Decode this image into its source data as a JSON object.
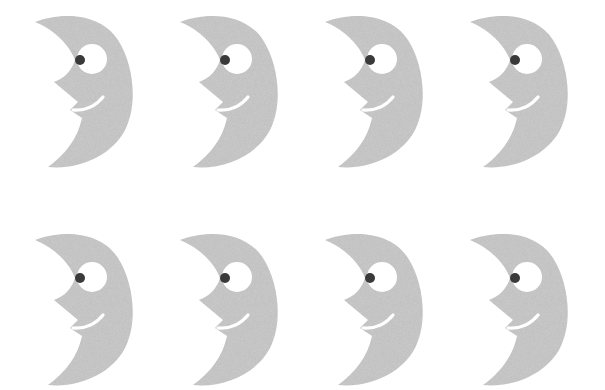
{
  "figure": {
    "rows": 2,
    "columns": 4,
    "colors": {
      "background": "#ffffff",
      "moon_fill": "#cdcdcd",
      "eye_white": "#ffffff",
      "pupil": "#3a3a3a",
      "smile": "#ffffff"
    },
    "moons": [
      {
        "row": 0,
        "col": 0,
        "x": 30,
        "y": 10
      },
      {
        "row": 0,
        "col": 1,
        "x": 175,
        "y": 10
      },
      {
        "row": 0,
        "col": 2,
        "x": 320,
        "y": 10
      },
      {
        "row": 0,
        "col": 3,
        "x": 465,
        "y": 10
      },
      {
        "row": 1,
        "col": 0,
        "x": 30,
        "y": 228
      },
      {
        "row": 1,
        "col": 1,
        "x": 175,
        "y": 228
      },
      {
        "row": 1,
        "col": 2,
        "x": 320,
        "y": 228
      },
      {
        "row": 1,
        "col": 3,
        "x": 465,
        "y": 228
      }
    ]
  }
}
